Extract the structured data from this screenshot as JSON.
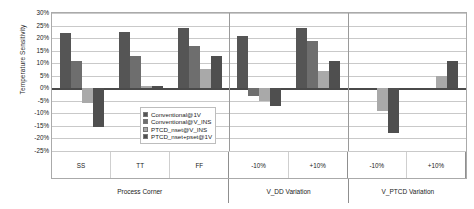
{
  "chart_data": {
    "type": "bar",
    "title": "",
    "xlabel": "",
    "ylabel": "Temperature Sensitivity",
    "ylim": [
      -25,
      30
    ],
    "ytick_step": 5,
    "grid": true,
    "legend_position": "center-inside",
    "yticks": [
      "30%",
      "25%",
      "20%",
      "15%",
      "10%",
      "5%",
      "0%",
      "-5%",
      "-10%",
      "-15%",
      "-20%",
      "-25%"
    ],
    "sections": [
      {
        "label": "Process Corner",
        "categories": [
          "SS",
          "TT",
          "FF"
        ]
      },
      {
        "label": "V_DD Variation",
        "categories": [
          "-10%",
          "+10%"
        ]
      },
      {
        "label": "V_PTCD Variation",
        "categories": [
          "-10%",
          "+10%"
        ]
      }
    ],
    "categories": [
      "SS",
      "TT",
      "FF",
      "-10%",
      "+10%",
      "-10%",
      "+10%"
    ],
    "series": [
      {
        "name": "Conventional@1V",
        "color": "#555555",
        "values": [
          22,
          22.5,
          24,
          21,
          24,
          0,
          0
        ]
      },
      {
        "name": "Conventional@V_INS",
        "color": "#6e6e6e",
        "values": [
          11,
          13,
          17,
          -3,
          19,
          0,
          0
        ]
      },
      {
        "name": "PTCD_nset@V_INS",
        "color": "#a9a9a9",
        "values": [
          -6,
          1,
          7.5,
          -5,
          7,
          -9,
          5
        ]
      },
      {
        "name": "PTCD_nset+pset@1V",
        "color": "#4f4f4f",
        "values": [
          -15.5,
          0.8,
          13,
          -7,
          11,
          -18,
          11
        ]
      }
    ]
  },
  "legend": {
    "items": [
      {
        "label": "Conventional@1V",
        "color": "#555555"
      },
      {
        "label": "Conventional@V_INS",
        "color": "#6e6e6e"
      },
      {
        "label": "PTCD_nset@V_INS",
        "color": "#a9a9a9"
      },
      {
        "label": "PTCD_nset+pset@1V",
        "color": "#4f4f4f"
      }
    ]
  }
}
